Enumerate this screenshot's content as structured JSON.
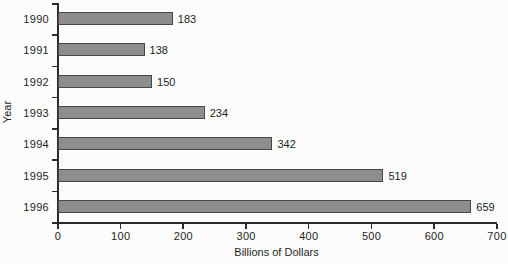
{
  "chart_data": {
    "type": "bar",
    "orientation": "horizontal",
    "title": "",
    "xlabel": "Billions of Dollars",
    "ylabel": "Year",
    "categories": [
      "1990",
      "1991",
      "1992",
      "1993",
      "1994",
      "1995",
      "1996"
    ],
    "values": [
      183,
      138,
      150,
      234,
      342,
      519,
      659
    ],
    "value_labels": [
      "183",
      "138",
      "150",
      "234",
      "342",
      "519",
      "659"
    ],
    "xlim": [
      0,
      700
    ],
    "xticks": [
      0,
      100,
      200,
      300,
      400,
      500,
      600,
      700
    ],
    "xtick_labels": [
      "0",
      "100",
      "200",
      "300",
      "400",
      "500",
      "600",
      "700"
    ],
    "grid": "off",
    "legend": "none",
    "colors": {
      "bar_fill": "#8d8d8d",
      "bar_border": "#474747",
      "axis": "#2b2b2b",
      "text": "#1e1e1e",
      "background": "#fcfcfc"
    }
  }
}
